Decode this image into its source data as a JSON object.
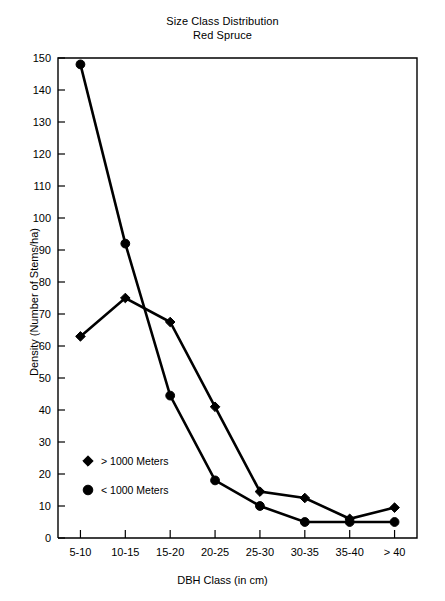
{
  "chart_data": {
    "type": "line",
    "title": "Size Class Distribution",
    "subtitle": "Red Spruce",
    "xlabel": "DBH Class (in cm)",
    "ylabel": "Density (Number of Stems/ha)",
    "categories": [
      "5-10",
      "10-15",
      "15-20",
      "20-25",
      "25-30",
      "30-35",
      "35-40",
      "> 40"
    ],
    "series": [
      {
        "name": "> 1000 Meters",
        "marker": "diamond",
        "color": "#000000",
        "values": [
          63,
          75,
          67.5,
          41,
          14.5,
          12.5,
          6,
          9.5
        ]
      },
      {
        "name": "< 1000 Meters",
        "marker": "circle",
        "color": "#000000",
        "values": [
          148,
          92,
          44.5,
          18,
          10,
          5,
          5,
          5
        ]
      }
    ],
    "ylim": [
      0,
      150
    ],
    "ytick_step": 10,
    "yticks": [
      0,
      10,
      20,
      30,
      40,
      50,
      60,
      70,
      80,
      90,
      100,
      110,
      120,
      130,
      140,
      150
    ],
    "ytick_labels": [
      "0",
      "10",
      "20",
      "30",
      "40",
      "50",
      "60",
      "70",
      "80",
      "90",
      "100",
      "110",
      "120",
      "130",
      "140",
      "150"
    ],
    "grid": false,
    "legend_position": "inside-lower-left",
    "legend": [
      {
        "label": "> 1000 Meters",
        "marker": "diamond"
      },
      {
        "label": "< 1000 Meters",
        "marker": "circle"
      }
    ]
  }
}
